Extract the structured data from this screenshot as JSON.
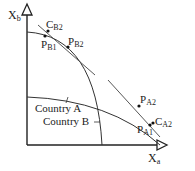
{
  "diagram": {
    "type": "production-possibility-frontiers",
    "axes": {
      "y": {
        "label_main": "X",
        "label_sub": "b"
      },
      "x": {
        "label_main": "X",
        "label_sub": "a"
      }
    },
    "curves": [
      {
        "name": "Country A",
        "label": "Country A",
        "description": "flatter PPF, extends further along X_a"
      },
      {
        "name": "Country B",
        "label": "Country B",
        "description": "steeper PPF, extends further along X_b"
      }
    ],
    "tangent_lines": [
      {
        "name": "upper-tangent",
        "touches": "P_B2"
      },
      {
        "name": "lower-tangent",
        "touches": "P_A2"
      }
    ],
    "points": [
      {
        "id": "C_B2",
        "main": "C",
        "sub": "B2"
      },
      {
        "id": "P_B1",
        "main": "P",
        "sub": "B1"
      },
      {
        "id": "P_B2",
        "main": "P",
        "sub": "B2"
      },
      {
        "id": "P_A2",
        "main": "P",
        "sub": "A2"
      },
      {
        "id": "P_A1",
        "main": "P",
        "sub": "A1"
      },
      {
        "id": "C_A2",
        "main": "C",
        "sub": "A2"
      }
    ],
    "colors": {
      "ink": "#222222",
      "background": "#ffffff"
    }
  }
}
